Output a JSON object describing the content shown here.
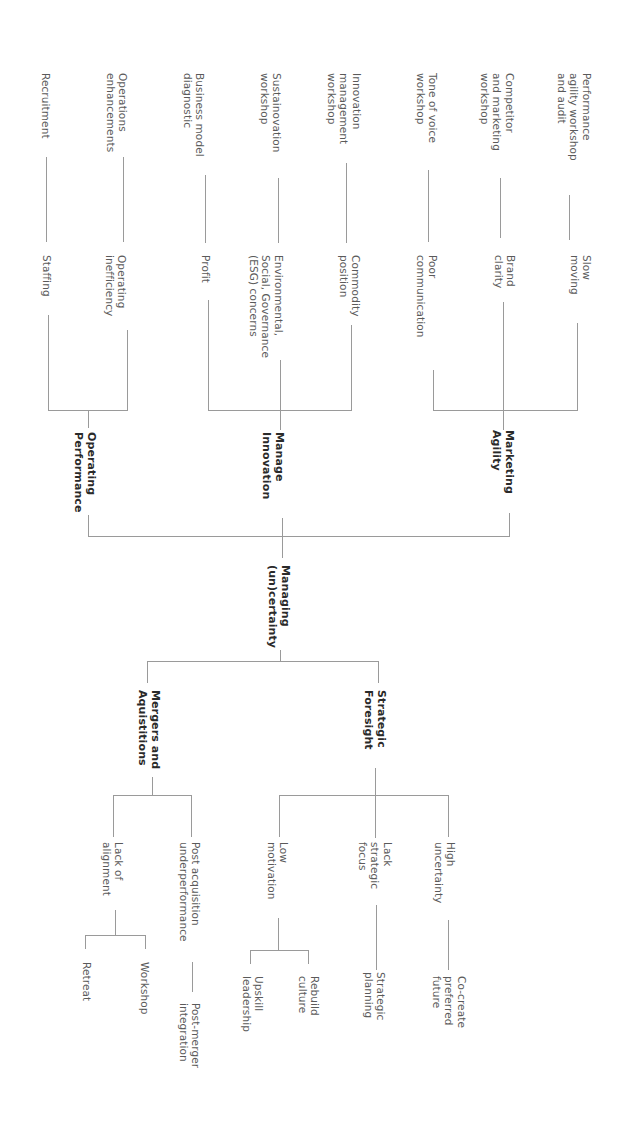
{
  "diagram": {
    "orientation": "rotated 90 degrees clockwise",
    "root": {
      "label": "Managing\n(un)certainty"
    },
    "upper_branch": {
      "categories": [
        {
          "label": "Marketing\nAgility",
          "items": [
            {
              "problem": "Slow\nmoving",
              "solution": "Performance\nagility workshop\nand audit"
            },
            {
              "problem": "Brand\nclarity",
              "solution": "Competitor\nand marketing\nworkshop"
            },
            {
              "problem": "Poor\ncommunication",
              "solution": "Tone of voice\nworkshop"
            }
          ]
        },
        {
          "label": "Manage\nInnovation",
          "items": [
            {
              "problem": "Commodity\nposition",
              "solution": "Innovation\nmanagement\nworkshop"
            },
            {
              "problem": "Environmental,\nSocial, Governance\n(ESG) concerns",
              "solution": "Sustainovation\nworkshop"
            },
            {
              "problem": "Profit",
              "solution": "Business model\ndiagnostic"
            }
          ]
        },
        {
          "label": "Operating\nPerformance",
          "items": [
            {
              "problem": "Operating\ninefficiency",
              "solution": "Operations\nenhancements"
            },
            {
              "problem": "Staffing",
              "solution": "Recruitment"
            }
          ]
        }
      ]
    },
    "lower_branch": {
      "categories": [
        {
          "label": "Strategic\nForesight",
          "items": [
            {
              "problem": "High\nuncertainty",
              "solutions": [
                "Co-create\npreferred\nfuture"
              ]
            },
            {
              "problem": "Lack\nstrategic\nfocus",
              "solutions": [
                "Strategic\nplanning"
              ]
            },
            {
              "problem": "Low\nmotivation",
              "solutions": [
                "Rebuild\nculture",
                "Upskill\nleadership"
              ]
            }
          ]
        },
        {
          "label": "Mergers and\nAquistitions",
          "items": [
            {
              "problem": "Post acquisition\nunderperformance",
              "solutions": [
                "Post-merger\nintegration"
              ]
            },
            {
              "problem": "Lack of\nalignment",
              "solutions": [
                "Workshop",
                "Retreat"
              ]
            }
          ]
        }
      ]
    },
    "line_color": "#9a9a9a"
  }
}
